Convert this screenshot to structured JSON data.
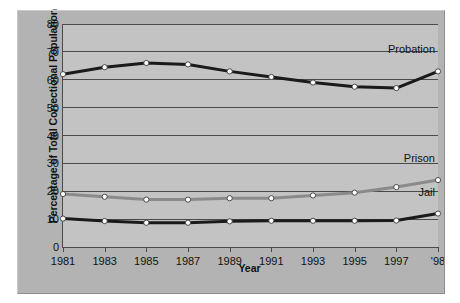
{
  "chart_data": {
    "type": "line",
    "title": "",
    "xlabel": "Year",
    "ylabel": "Percentage of Total Correctional Population",
    "categories": [
      "1981",
      "1983",
      "1985",
      "1987",
      "1989",
      "1991",
      "1993",
      "1995",
      "1997",
      "'98"
    ],
    "x_tick_labels": [
      "1981",
      "1983",
      "1985",
      "1987",
      "1989",
      "1991",
      "1993",
      "1995",
      "1997",
      "'98"
    ],
    "y_tick_labels": [
      "0",
      "10",
      "20",
      "30",
      "40",
      "50",
      "60",
      "70",
      "80"
    ],
    "ylim": [
      0,
      80
    ],
    "y_tick_step": 10,
    "grid": true,
    "legend_position": "inline-right-labels",
    "series": [
      {
        "name": "Probation",
        "color": "#1a1a1a",
        "values": [
          62,
          64.5,
          66,
          65.5,
          63,
          61,
          59,
          57.5,
          57,
          63
        ]
      },
      {
        "name": "Prison",
        "color": "#8a8a8a",
        "values": [
          19,
          18,
          17,
          17,
          17.5,
          17.5,
          18.5,
          19.5,
          21.5,
          24
        ]
      },
      {
        "name": "Jail",
        "color": "#1a1a1a",
        "values": [
          10.2,
          9.3,
          8.7,
          8.7,
          9.2,
          9.4,
          9.4,
          9.4,
          9.5,
          12
        ]
      }
    ],
    "annotations": [
      {
        "text": "Probation",
        "series": "Probation",
        "at_x": "'98"
      },
      {
        "text": "Prison",
        "series": "Prison",
        "at_x": "'98"
      },
      {
        "text": "Jail",
        "series": "Jail",
        "at_x": "'98"
      }
    ]
  },
  "colors": {
    "figure_background": "#b3b3b3",
    "plot_background": "#c3c3c3",
    "axis": "#4a4a4a",
    "probation_line": "#1a1a1a",
    "prison_line": "#8a8a8a",
    "jail_line": "#1a1a1a",
    "marker_fill": "#ffffff",
    "text": "#111111"
  }
}
